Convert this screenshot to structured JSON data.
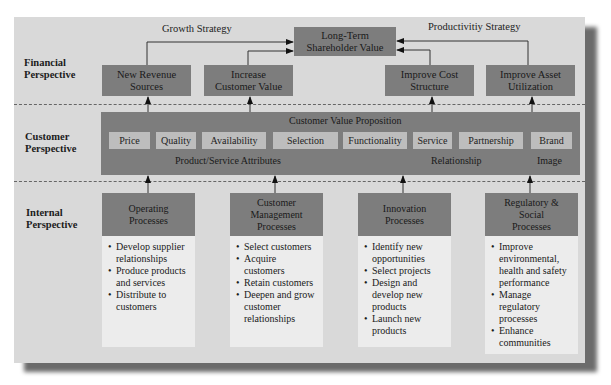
{
  "perspectives": {
    "financial": "Financial\nPerspective",
    "customer": "Customer\nPerspective",
    "internal": "Internal\nPerspective"
  },
  "strategies": {
    "growth": "Growth Strategy",
    "productivity": "Productivitiy Strategy"
  },
  "top_goal": "Long-Term\nShareholder Value",
  "financial_boxes": [
    {
      "label": "New Revenue\nSources"
    },
    {
      "label": "Increase\nCustomer Value"
    },
    {
      "label": "Improve Cost\nStructure"
    },
    {
      "label": "Improve Asset\nUtilization"
    }
  ],
  "customer": {
    "title": "Customer Value Proposition",
    "attributes": [
      "Price",
      "Quality",
      "Availability",
      "Selection",
      "Functionality",
      "Service",
      "Partnership",
      "Brand"
    ],
    "group_labels": {
      "product_service": "Product/Service Attributes",
      "relationship": "Relationship",
      "image": "Image"
    }
  },
  "processes": [
    {
      "title": "Operating\nProcesses",
      "items": [
        "Develop supplier relationships",
        "Produce products and services",
        "Distribute to customers"
      ]
    },
    {
      "title": "Customer\nManagement\nProcesses",
      "items": [
        "Select customers",
        "Acquire customers",
        "Retain customers",
        "Deepen and grow customer relationships"
      ]
    },
    {
      "title": "Innovation\nProcesses",
      "items": [
        "Identify new opportunities",
        "Select projects",
        "Design and develop new products",
        "Launch new products"
      ]
    },
    {
      "title": "Regulatory &\nSocial\nProcesses",
      "items": [
        "Improve environmental, health and safety performance",
        "Manage regulatory processes",
        "Enhance communities"
      ]
    }
  ],
  "colors": {
    "panel": "#d9d9d9",
    "box": "#7d7d7d",
    "chip": "#bdbdbd",
    "process_body": "#ececec",
    "shadow": "#6b6b6b"
  }
}
